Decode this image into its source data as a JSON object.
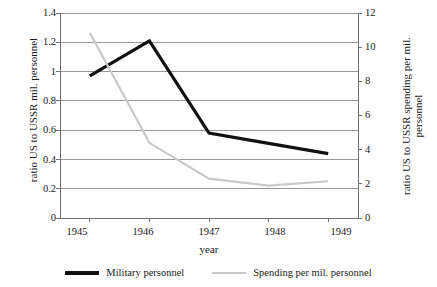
{
  "chart_data": {
    "type": "line",
    "title": "",
    "xlabel": "year",
    "categories": [
      "1945",
      "1946",
      "1947",
      "1948",
      "1949"
    ],
    "x": [
      1945,
      1946,
      1947,
      1948,
      1949
    ],
    "grid": true,
    "legend_position": "bottom",
    "axes": {
      "left": {
        "label": "ratio US to USSR mil. personnel",
        "ticks": [
          "0",
          "0.2",
          "0.4",
          "0.6",
          "0.8",
          "1",
          "1.2",
          "1.4"
        ],
        "tick_values": [
          0,
          0.2,
          0.4,
          0.6,
          0.8,
          1,
          1.2,
          1.4
        ],
        "range": [
          0,
          1.4
        ]
      },
      "right": {
        "label": "ratio US to USSR spending per mil. personnel",
        "ticks": [
          "0",
          "2",
          "4",
          "6",
          "8",
          "10",
          "12"
        ],
        "tick_values": [
          0,
          2,
          4,
          6,
          8,
          10,
          12
        ],
        "range": [
          0,
          12
        ]
      }
    },
    "series": [
      {
        "name": "Military personnel",
        "axis": "left",
        "color": "#111111",
        "width": 3.2,
        "values": [
          0.97,
          1.21,
          0.58,
          0.51,
          0.44
        ]
      },
      {
        "name": "Spending per mil. personnel",
        "axis": "right",
        "color": "#c9c9c9",
        "width": 2.2,
        "values": [
          10.85,
          4.4,
          2.3,
          1.9,
          2.15
        ]
      }
    ]
  },
  "legend": {
    "entries": [
      {
        "label": "Military personnel"
      },
      {
        "label": "Spending per mil. personnel"
      }
    ]
  },
  "colors": {
    "series_military": "#111111",
    "series_spending": "#c9c9c9",
    "grid": "#8c8c8c",
    "axis": "#6f6f6f",
    "text": "#1a1a1a",
    "background": "#ffffff"
  }
}
